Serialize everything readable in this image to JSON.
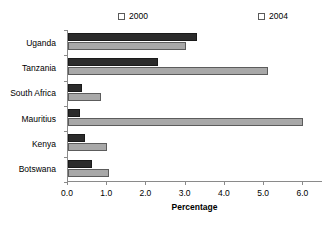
{
  "chart_data": {
    "type": "bar",
    "orientation": "horizontal",
    "title": "",
    "subtitle": "",
    "xlabel": "Percentage",
    "ylabel": "",
    "xlim": [
      0.0,
      6.5
    ],
    "xticks": [
      "0.0",
      "1.0",
      "2.0",
      "3.0",
      "4.0",
      "5.0",
      "6.0"
    ],
    "xtick_values": [
      0.0,
      1.0,
      2.0,
      3.0,
      4.0,
      5.0,
      6.0
    ],
    "grid": false,
    "legend_position": "top",
    "categories": [
      "Uganda",
      "Tanzania",
      "South Africa",
      "Mauritius",
      "Kenya",
      "Botswana"
    ],
    "series": [
      {
        "name": "2000",
        "color": "#a8a8a8",
        "values": [
          3.0,
          5.1,
          0.85,
          6.0,
          1.0,
          1.05
        ]
      },
      {
        "name": "2004",
        "color": "#2b2b2b",
        "values": [
          3.3,
          2.3,
          0.35,
          0.3,
          0.43,
          0.6
        ]
      }
    ]
  },
  "legend": {
    "entries": [
      {
        "label": "2000",
        "color": "#a8a8a8"
      },
      {
        "label": "2004",
        "color": "#2b2b2b"
      }
    ]
  },
  "axis": {
    "x_title": "Percentage"
  }
}
